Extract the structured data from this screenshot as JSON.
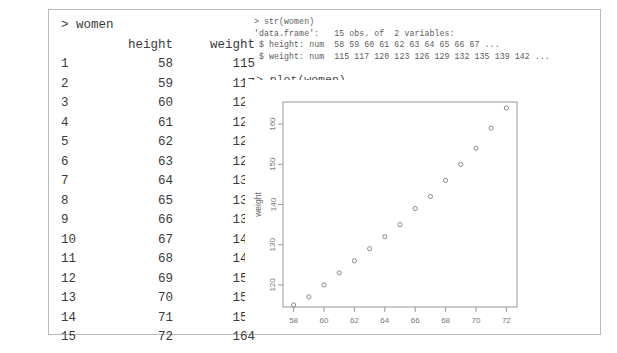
{
  "console": {
    "prompt": ">",
    "left": {
      "command": "> women",
      "headers": {
        "index": "",
        "height": "height",
        "weight": "weight"
      },
      "rows": [
        {
          "index": "1",
          "height": "58",
          "weight": "115"
        },
        {
          "index": "2",
          "height": "59",
          "weight": "117"
        },
        {
          "index": "3",
          "height": "60",
          "weight": "120"
        },
        {
          "index": "4",
          "height": "61",
          "weight": "123"
        },
        {
          "index": "5",
          "height": "62",
          "weight": "126"
        },
        {
          "index": "6",
          "height": "63",
          "weight": "129"
        },
        {
          "index": "7",
          "height": "64",
          "weight": "132"
        },
        {
          "index": "8",
          "height": "65",
          "weight": "135"
        },
        {
          "index": "9",
          "height": "66",
          "weight": "139"
        },
        {
          "index": "10",
          "height": "67",
          "weight": "142"
        },
        {
          "index": "11",
          "height": "68",
          "weight": "146"
        },
        {
          "index": "12",
          "height": "69",
          "weight": "150"
        },
        {
          "index": "13",
          "height": "70",
          "weight": "154"
        },
        {
          "index": "14",
          "height": "71",
          "weight": "159"
        },
        {
          "index": "15",
          "height": "72",
          "weight": "164"
        }
      ]
    },
    "right": {
      "str_command": "> str(women)",
      "str_output": [
        "'data.frame':   15 obs. of  2 variables:",
        " $ height: num  58 59 60 61 62 63 64 65 66 67 ...",
        " $ weight: num  115 117 120 123 126 129 132 135 139 142 ..."
      ],
      "plot_command": "> plot(women)"
    }
  },
  "chart_data": {
    "type": "scatter",
    "title": "",
    "xlabel": "height",
    "ylabel": "weight",
    "xlim": [
      57.3,
      72.7
    ],
    "ylim": [
      114.5,
      165.5
    ],
    "xticks": [
      58,
      60,
      62,
      64,
      66,
      68,
      70,
      72
    ],
    "yticks": [
      120,
      130,
      140,
      150,
      160
    ],
    "grid": false,
    "legend": null,
    "marker": "open-circle",
    "marker_color": "#8a8a8a",
    "x": [
      58,
      59,
      60,
      61,
      62,
      63,
      64,
      65,
      66,
      67,
      68,
      69,
      70,
      71,
      72
    ],
    "y": [
      115,
      117,
      120,
      123,
      126,
      129,
      132,
      135,
      139,
      142,
      146,
      150,
      154,
      159,
      164
    ]
  },
  "colors": {
    "frame_border": "#b9b9b9",
    "console_text": "#3a3a3a",
    "small_text": "#5c5c5c",
    "axis": "#999999",
    "background": "#ffffff"
  }
}
